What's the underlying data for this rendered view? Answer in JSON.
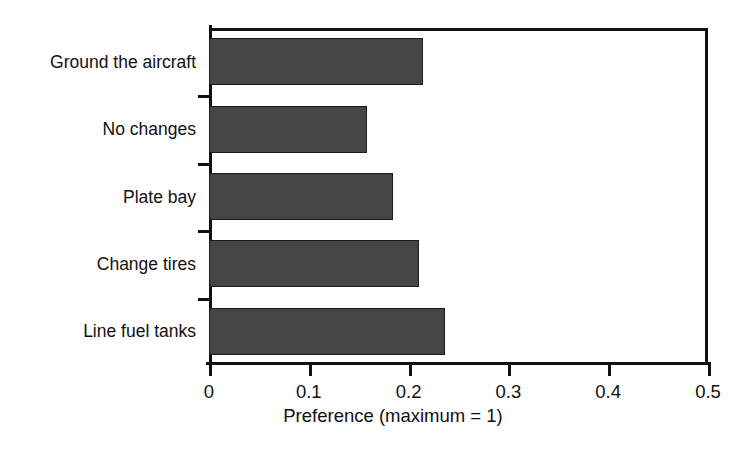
{
  "chart_data": {
    "type": "bar",
    "orientation": "horizontal",
    "title": "",
    "subtitle": "",
    "xlabel": "Preference (maximum = 1)",
    "ylabel": "",
    "categories": [
      "Ground the aircraft",
      "No changes",
      "Plate bay",
      "Change tires",
      "Line fuel tanks"
    ],
    "values": [
      0.214,
      0.158,
      0.184,
      0.21,
      0.236
    ],
    "series": [
      {
        "name": "Preference",
        "values": [
          0.214,
          0.158,
          0.184,
          0.21,
          0.236
        ]
      }
    ],
    "xlim": [
      0,
      0.5
    ],
    "xticks": [
      0,
      0.1,
      0.2,
      0.3,
      0.4,
      0.5
    ],
    "xtick_labels": [
      "0",
      "0.1",
      "0.2",
      "0.3",
      "0.4",
      "0.5"
    ],
    "grid": false,
    "legend": false,
    "legend_position": "none",
    "bar_color": "#454545",
    "bar_edge_color": "#1a1a1a",
    "axis_color": "#111111",
    "background_color": "#ffffff"
  }
}
